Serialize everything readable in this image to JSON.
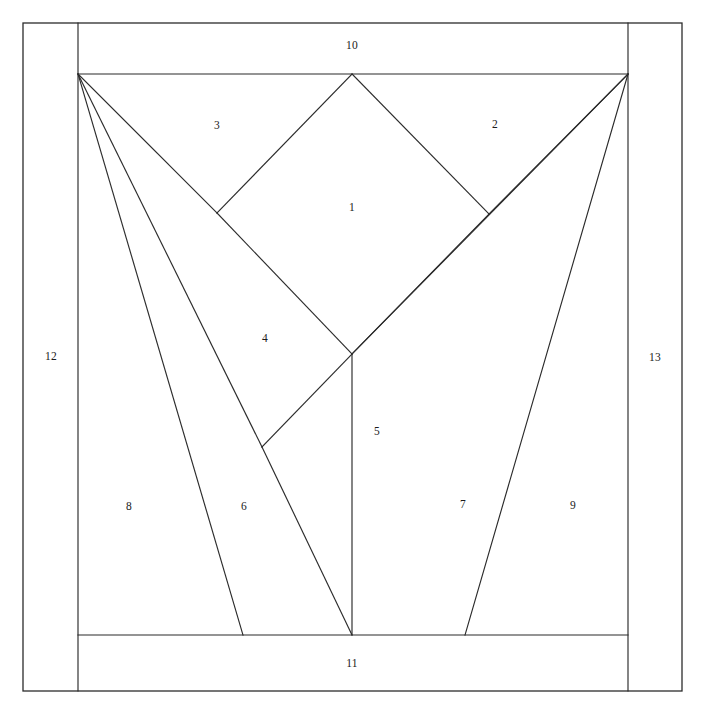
{
  "figure": {
    "type": "line-diagram",
    "width": 705,
    "height": 716,
    "background_color": "#ffffff",
    "stroke_color": "#2b2b2b"
  },
  "frame": {
    "outer_rect": {
      "x": 23,
      "y": 23,
      "width": 659,
      "height": 668
    },
    "inner_left_x": 78,
    "inner_right_x": 628,
    "inner_top_y": 74,
    "inner_bottom_y": 635
  },
  "vertices": {
    "top_left": {
      "x": 78,
      "y": 74
    },
    "top_right": {
      "x": 628,
      "y": 74
    },
    "diamond_top": {
      "x": 352,
      "y": 74
    },
    "diamond_left": {
      "x": 217,
      "y": 213
    },
    "diamond_right": {
      "x": 489,
      "y": 214
    },
    "diamond_bottom": {
      "x": 352,
      "y": 354
    },
    "mid_left_kink": {
      "x": 262,
      "y": 447
    },
    "base_left": {
      "x": 243,
      "y": 635
    },
    "base_center": {
      "x": 352,
      "y": 635
    },
    "base_right": {
      "x": 465,
      "y": 635
    }
  },
  "edges": [
    {
      "name": "outer-border",
      "kind": "rect",
      "x": 23,
      "y": 23,
      "width": 659,
      "height": 668
    },
    {
      "name": "inner-left-vertical",
      "kind": "line",
      "x1": 78,
      "y1": 23,
      "x2": 78,
      "y2": 691
    },
    {
      "name": "inner-right-vertical",
      "kind": "line",
      "x1": 628,
      "y1": 23,
      "x2": 628,
      "y2": 691
    },
    {
      "name": "top-horizontal",
      "kind": "line",
      "x1": 78,
      "y1": 74,
      "x2": 628,
      "y2": 74
    },
    {
      "name": "bottom-horizontal",
      "kind": "line",
      "x1": 78,
      "y1": 635,
      "x2": 628,
      "y2": 635
    },
    {
      "name": "diamond-upper-left",
      "kind": "line",
      "x1": 352,
      "y1": 74,
      "x2": 217,
      "y2": 213
    },
    {
      "name": "diamond-upper-right",
      "kind": "line",
      "x1": 352,
      "y1": 74,
      "x2": 489,
      "y2": 214
    },
    {
      "name": "diamond-lower-left",
      "kind": "line",
      "x1": 217,
      "y1": 213,
      "x2": 352,
      "y2": 354
    },
    {
      "name": "diamond-lower-right",
      "kind": "line",
      "x1": 489,
      "y1": 214,
      "x2": 352,
      "y2": 354
    },
    {
      "name": "ray-tl-to-diamond-left",
      "kind": "line",
      "x1": 78,
      "y1": 74,
      "x2": 217,
      "y2": 213
    },
    {
      "name": "ray-tl-to-mid-kink",
      "kind": "line",
      "x1": 78,
      "y1": 74,
      "x2": 262,
      "y2": 447
    },
    {
      "name": "ray-tl-to-base-left",
      "kind": "line",
      "x1": 78,
      "y1": 74,
      "x2": 243,
      "y2": 635
    },
    {
      "name": "edge-mid-kink-to-base-center",
      "kind": "line",
      "x1": 262,
      "y1": 447,
      "x2": 352,
      "y2": 635
    },
    {
      "name": "edge-mid-kink-to-diamond-bottom",
      "kind": "line",
      "x1": 262,
      "y1": 447,
      "x2": 352,
      "y2": 354
    },
    {
      "name": "ray-tr-to-diamond-right",
      "kind": "line",
      "x1": 628,
      "y1": 74,
      "x2": 489,
      "y2": 214
    },
    {
      "name": "ray-tr-through-diamond-bottom-to-base-center",
      "kind": "line",
      "x1": 628,
      "y1": 74,
      "x2": 352,
      "y2": 354
    },
    {
      "name": "ray-diamond-bottom-to-base-center",
      "kind": "line",
      "x1": 352,
      "y1": 354,
      "x2": 352,
      "y2": 635
    },
    {
      "name": "ray-tr-to-base-right",
      "kind": "line",
      "x1": 628,
      "y1": 74,
      "x2": 465,
      "y2": 635
    }
  ],
  "labels": [
    {
      "id": "region-1",
      "text": "1",
      "x": 352,
      "y": 207
    },
    {
      "id": "region-2",
      "text": "2",
      "x": 495,
      "y": 124
    },
    {
      "id": "region-3",
      "text": "3",
      "x": 217,
      "y": 125
    },
    {
      "id": "region-4",
      "text": "4",
      "x": 265,
      "y": 338
    },
    {
      "id": "region-5",
      "text": "5",
      "x": 377,
      "y": 431
    },
    {
      "id": "region-6",
      "text": "6",
      "x": 244,
      "y": 506
    },
    {
      "id": "region-7",
      "text": "7",
      "x": 463,
      "y": 504
    },
    {
      "id": "region-8",
      "text": "8",
      "x": 129,
      "y": 506
    },
    {
      "id": "region-9",
      "text": "9",
      "x": 573,
      "y": 505
    },
    {
      "id": "region-10",
      "text": "10",
      "x": 352,
      "y": 45
    },
    {
      "id": "region-11",
      "text": "11",
      "x": 352,
      "y": 663
    },
    {
      "id": "region-12",
      "text": "12",
      "x": 51,
      "y": 356
    },
    {
      "id": "region-13",
      "text": "13",
      "x": 655,
      "y": 357
    }
  ]
}
